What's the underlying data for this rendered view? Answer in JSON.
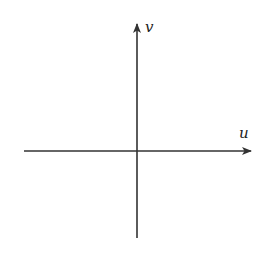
{
  "diagram": {
    "type": "coordinate-axes",
    "axes": {
      "horizontal": {
        "label": "u",
        "direction": "right"
      },
      "vertical": {
        "label": "v",
        "direction": "up"
      }
    },
    "colors": {
      "stroke": "#333333",
      "background": "#ffffff"
    }
  }
}
